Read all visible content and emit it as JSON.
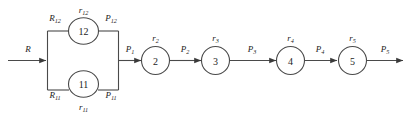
{
  "diagram": {
    "type": "flow-network",
    "colors": {
      "stroke": "#4a4a4a",
      "text": "#1c1c1c",
      "arrow": "#3a3a3a",
      "background": "#ffffff"
    },
    "input": {
      "label": "R",
      "label_base": "R",
      "label_sub": ""
    },
    "parallel_block": {
      "branches": [
        {
          "id": "branch-top",
          "node_label": "12",
          "resource_in": {
            "base": "R",
            "sub": "12"
          },
          "rate": {
            "base": "r",
            "sub": "12"
          },
          "product_out": {
            "base": "P",
            "sub": "12"
          }
        },
        {
          "id": "branch-bottom",
          "node_label": "11",
          "resource_in": {
            "base": "R",
            "sub": "11"
          },
          "rate": {
            "base": "r",
            "sub": "11"
          },
          "product_out": {
            "base": "P",
            "sub": "11"
          }
        }
      ]
    },
    "merge_flow": {
      "base": "P",
      "sub": "1"
    },
    "chain": [
      {
        "id": "stage-2",
        "node_label": "2",
        "rate": {
          "base": "r",
          "sub": "2"
        },
        "output_flow": {
          "base": "P",
          "sub": "2"
        }
      },
      {
        "id": "stage-3",
        "node_label": "3",
        "rate": {
          "base": "r",
          "sub": "3"
        },
        "output_flow": {
          "base": "P",
          "sub": "3"
        }
      },
      {
        "id": "stage-4",
        "node_label": "4",
        "rate": {
          "base": "r",
          "sub": "4"
        },
        "output_flow": {
          "base": "P",
          "sub": "4"
        }
      },
      {
        "id": "stage-5",
        "node_label": "5",
        "rate": {
          "base": "r",
          "sub": "5"
        },
        "output_flow": {
          "base": "P",
          "sub": "5"
        }
      }
    ]
  }
}
